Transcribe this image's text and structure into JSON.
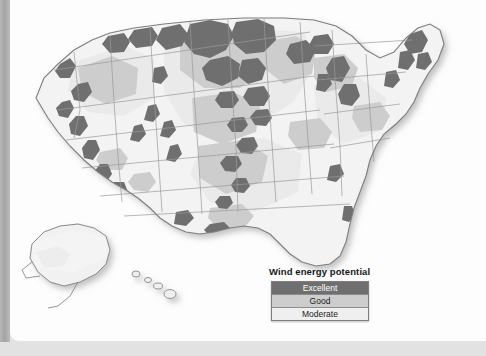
{
  "figure": {
    "map_regions": [
      "contiguous united states",
      "alaska",
      "hawaii"
    ]
  },
  "legend": {
    "title": "Wind energy potential",
    "items": [
      {
        "label": "Excellent",
        "color": "#6f6f6f",
        "text_color": "#ffffff"
      },
      {
        "label": "Good",
        "color": "#cdcdcd",
        "text_color": "#1c1c1c"
      },
      {
        "label": "Moderate",
        "color": "#efefef",
        "text_color": "#1c1c1c"
      }
    ]
  },
  "palette": {
    "page_background": "#e4e4e4",
    "page_white": "#fdfdfd",
    "gutter_strip": "#a4a4a4",
    "land_base": "#f3f3f3",
    "state_border": "#b9b9b9",
    "coast_outline": "#8a8a8a",
    "excellent": "#6f6f6f",
    "good": "#cdcdcd",
    "moderate": "#efefef",
    "shadow": "rgba(120,120,120,0.45)"
  }
}
